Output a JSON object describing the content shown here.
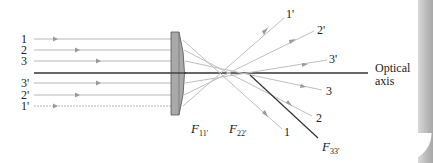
{
  "figure": {
    "optical_axis_label_line1": "Optical",
    "optical_axis_label_line2": "axis",
    "incoming_rays": [
      {
        "id": "1",
        "label": "1",
        "y": 39
      },
      {
        "id": "2",
        "label": "2",
        "y": 50
      },
      {
        "id": "3",
        "label": "3",
        "y": 61
      },
      {
        "id": "3p",
        "label": "3'",
        "y": 83
      },
      {
        "id": "2p",
        "label": "2'",
        "y": 95
      },
      {
        "id": "1p",
        "label": "1'",
        "y": 106
      }
    ],
    "outgoing_labels": [
      {
        "id": "1p_out",
        "label": "1'"
      },
      {
        "id": "2p_out",
        "label": "2'"
      },
      {
        "id": "3p_out",
        "label": "3'"
      },
      {
        "id": "3_out",
        "label": "3"
      },
      {
        "id": "2_out",
        "label": "2"
      },
      {
        "id": "1_out",
        "label": "1"
      }
    ],
    "focal_points": [
      {
        "id": "F11",
        "main": "F",
        "sub": "11'"
      },
      {
        "id": "F22",
        "main": "F",
        "sub": "22'"
      },
      {
        "id": "F33",
        "main": "F",
        "sub": "33'"
      }
    ],
    "colors": {
      "ray": "#b8b8b8",
      "ray_arrow": "#a0a0a0",
      "axis": "#333333",
      "lens_fill": "#a9a9a9",
      "lens_edge": "#555555",
      "text": "#222222"
    }
  }
}
